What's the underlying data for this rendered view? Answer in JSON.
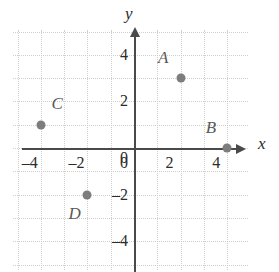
{
  "chart_data": {
    "type": "scatter",
    "title": "",
    "xlabel": "x",
    "ylabel": "y",
    "xlim": [
      -5,
      5
    ],
    "ylim": [
      -5,
      5
    ],
    "grid": true,
    "grid_step": 1,
    "legend": "none",
    "x_ticks": [
      {
        "value": -4,
        "label": "–4"
      },
      {
        "value": -2,
        "label": "–2"
      },
      {
        "value": 0,
        "label": "0"
      },
      {
        "value": 2,
        "label": "2"
      },
      {
        "value": 4,
        "label": "4"
      }
    ],
    "y_ticks": [
      {
        "value": 4,
        "label": "4"
      },
      {
        "value": 2,
        "label": "2"
      },
      {
        "value": 0,
        "label": "0"
      },
      {
        "value": -2,
        "label": "–2"
      },
      {
        "value": -4,
        "label": "–4"
      }
    ],
    "points": [
      {
        "name": "A",
        "x": 2,
        "y": 3,
        "label_dx": -0.75,
        "label_dy": 0.85
      },
      {
        "name": "B",
        "x": 4,
        "y": 0,
        "label_dx": -0.7,
        "label_dy": 0.85
      },
      {
        "name": "C",
        "x": -4,
        "y": 1,
        "label_dx": 0.7,
        "label_dy": 0.9
      },
      {
        "name": "D",
        "x": -2,
        "y": -2,
        "label_dx": -0.55,
        "label_dy": -0.85
      }
    ],
    "colors": {
      "point": "#7d7d7d",
      "point_label": "#595959",
      "axis": "#4a4a4a",
      "grid": "#cfcfcf",
      "tick_label": "#2b2b2b",
      "background": "#ffffff"
    }
  }
}
